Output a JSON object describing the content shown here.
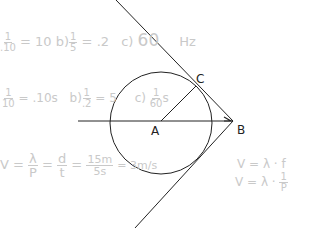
{
  "diagram": {
    "points": {
      "A": {
        "label": "A",
        "x": 161,
        "y": 121
      },
      "B": {
        "label": "B",
        "x": 233,
        "y": 121
      },
      "C": {
        "label": "C",
        "x": 196,
        "y": 85
      }
    },
    "circle": {
      "cx": 161,
      "cy": 123,
      "r": 51
    },
    "colors": {
      "ink": "#222222",
      "faint": "#c9c9c9"
    }
  },
  "notes": {
    "row1": {
      "a_num": "1",
      "a_den": ".10",
      "a_eq": "= 10",
      "b_prefix": "b)",
      "b_num": "1",
      "b_den": "5",
      "b_eq": "= .2",
      "c_prefix": "c)",
      "c_val": "60",
      "c_unit": "Hz"
    },
    "row2": {
      "a_num": "1",
      "a_den": "10",
      "a_eq": "= .10s",
      "b_prefix": "b)",
      "b_num": "1",
      "b_den": ".2",
      "b_eq": "= 5",
      "c_prefix": "c)",
      "c_num": "1",
      "c_den": "60",
      "c_unit": "s"
    },
    "row3": {
      "v": "V =",
      "lam": "λ",
      "per": "P",
      "eq1": "=",
      "d": "d",
      "t": "t",
      "eq2": "=",
      "num": "15m",
      "den": "5s",
      "eq3": "= 3m/s"
    },
    "formula": {
      "line1": "V = λ · f",
      "line2_prefix": "V = λ ·",
      "line2_num": "1",
      "line2_den": "P"
    }
  }
}
